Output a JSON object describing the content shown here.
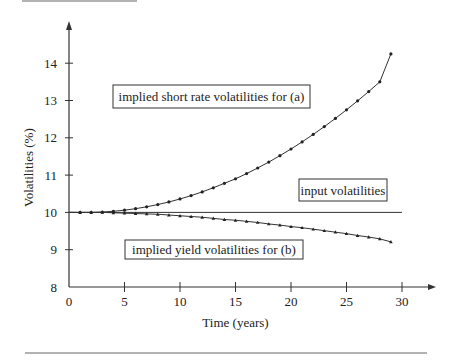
{
  "chart_data": {
    "type": "line",
    "title": "",
    "xlabel": "Time (years)",
    "ylabel": "Volatilities (%)",
    "xlim": [
      0,
      30
    ],
    "ylim": [
      8,
      14.8
    ],
    "xticks": [
      0,
      5,
      10,
      15,
      20,
      25,
      30
    ],
    "yticks": [
      8,
      9,
      10,
      11,
      12,
      13,
      14
    ],
    "grid": false,
    "annotations": [
      {
        "text": "implied short rate volatilities for (a)",
        "boxed": true
      },
      {
        "text": "input volatilities",
        "boxed": true
      },
      {
        "text": "implied yield volatilities for (b)",
        "boxed": true
      }
    ],
    "series": [
      {
        "name": "input volatilities",
        "marker": "none",
        "x": [
          0,
          30
        ],
        "values": [
          10,
          10
        ]
      },
      {
        "name": "implied short rate volatilities for (a)",
        "marker": "dot",
        "x": [
          1,
          2,
          3,
          4,
          5,
          6,
          7,
          8,
          9,
          10,
          11,
          12,
          13,
          14,
          15,
          16,
          17,
          18,
          19,
          20,
          21,
          22,
          23,
          24,
          25,
          26,
          27,
          28,
          29
        ],
        "values": [
          10.0,
          10.0,
          10.01,
          10.03,
          10.06,
          10.1,
          10.15,
          10.21,
          10.28,
          10.36,
          10.45,
          10.55,
          10.66,
          10.78,
          10.9,
          11.04,
          11.19,
          11.35,
          11.52,
          11.7,
          11.89,
          12.09,
          12.3,
          12.52,
          12.75,
          12.99,
          13.24,
          13.5,
          14.25
        ]
      },
      {
        "name": "implied yield volatilities for (b)",
        "marker": "triangle",
        "x": [
          1,
          2,
          3,
          4,
          5,
          6,
          7,
          8,
          9,
          10,
          11,
          12,
          13,
          14,
          15,
          16,
          17,
          18,
          19,
          20,
          21,
          22,
          23,
          24,
          25,
          26,
          27,
          28,
          29
        ],
        "values": [
          10.0,
          10.0,
          10.0,
          9.99,
          9.98,
          9.97,
          9.96,
          9.95,
          9.93,
          9.91,
          9.89,
          9.87,
          9.84,
          9.81,
          9.79,
          9.76,
          9.73,
          9.69,
          9.66,
          9.62,
          9.59,
          9.55,
          9.51,
          9.47,
          9.43,
          9.38,
          9.34,
          9.29,
          9.21
        ]
      }
    ]
  }
}
